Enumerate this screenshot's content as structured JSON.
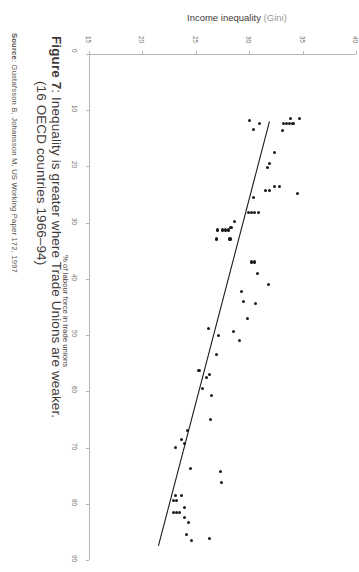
{
  "caption": {
    "figure_label": "Figure 7",
    "line1": ": Inequality is greater where Trade Unions are weaker.",
    "line2": "(16 OECD countries 1966–94)",
    "full_line1": "Figure 7: Inequality is greater where Trade Unions are weaker.",
    "full_line2": "(16 OECD countries 1966–94)"
  },
  "source": {
    "label": "Source",
    "text": ": Gustafsson B, Johansson M, US Working Paper 172, 1997"
  },
  "chart_data": {
    "type": "scatter",
    "title": "Figure 7: Inequality is greater where Trade Unions are weaker. (16 OECD countries 1966–94)",
    "xlabel": "Income inequality (Gini)",
    "xlabel_main": "Income inequality",
    "xlabel_paren": "(Gini)",
    "ylabel": "% of labour force in trade unions",
    "xlim": [
      15,
      40
    ],
    "ylim": [
      0,
      90
    ],
    "xticks": [
      15,
      20,
      25,
      30,
      35,
      40
    ],
    "yticks": [
      0,
      10,
      20,
      30,
      40,
      50,
      60,
      70,
      80,
      90
    ],
    "grid": false,
    "legend": "none",
    "axis_orientation": "x-axis on top, y-axis inverted (0 at top, 90 at bottom); whole figure rotated 90 degrees",
    "marker_color": "#1b1b1b",
    "axis_color": "#b9b7b5",
    "trendline": {
      "present": true,
      "color": "#1b1b1b",
      "description": "negative slope: higher union density associates with lower Gini",
      "x_start": 31.9,
      "y_start": 12.0,
      "x_end": 21.5,
      "y_end": 87.5
    },
    "points": [
      {
        "x": 33.9,
        "y": 11.5
      },
      {
        "x": 34.7,
        "y": 11.5
      },
      {
        "x": 30.0,
        "y": 11.8
      },
      {
        "x": 33.2,
        "y": 12.3
      },
      {
        "x": 33.5,
        "y": 12.3
      },
      {
        "x": 33.8,
        "y": 12.3
      },
      {
        "x": 34.1,
        "y": 12.3
      },
      {
        "x": 31.0,
        "y": 12.4
      },
      {
        "x": 30.4,
        "y": 13.4
      },
      {
        "x": 33.1,
        "y": 13.6
      },
      {
        "x": 32.4,
        "y": 17.5
      },
      {
        "x": 31.9,
        "y": 19.5
      },
      {
        "x": 31.7,
        "y": 20.2
      },
      {
        "x": 32.4,
        "y": 23.6
      },
      {
        "x": 32.8,
        "y": 23.6
      },
      {
        "x": 31.5,
        "y": 24.3
      },
      {
        "x": 31.9,
        "y": 24.2
      },
      {
        "x": 34.5,
        "y": 24.8
      },
      {
        "x": 30.4,
        "y": 25.5
      },
      {
        "x": 29.9,
        "y": 28.2
      },
      {
        "x": 30.2,
        "y": 28.2
      },
      {
        "x": 30.5,
        "y": 28.2
      },
      {
        "x": 30.9,
        "y": 28.2
      },
      {
        "x": 28.6,
        "y": 29.8
      },
      {
        "x": 27.0,
        "y": 31.3
      },
      {
        "x": 27.5,
        "y": 31.3
      },
      {
        "x": 27.8,
        "y": 31.3
      },
      {
        "x": 28.1,
        "y": 31.3
      },
      {
        "x": 28.3,
        "y": 30.9
      },
      {
        "x": 26.9,
        "y": 32.9
      },
      {
        "x": 28.2,
        "y": 32.9
      },
      {
        "x": 30.2,
        "y": 37.0
      },
      {
        "x": 30.5,
        "y": 37.0
      },
      {
        "x": 30.8,
        "y": 39.1
      },
      {
        "x": 31.8,
        "y": 41.0
      },
      {
        "x": 29.3,
        "y": 42.2
      },
      {
        "x": 29.5,
        "y": 44.0
      },
      {
        "x": 30.6,
        "y": 44.4
      },
      {
        "x": 29.8,
        "y": 47.1
      },
      {
        "x": 26.2,
        "y": 48.9
      },
      {
        "x": 28.5,
        "y": 49.4
      },
      {
        "x": 27.1,
        "y": 50.0
      },
      {
        "x": 29.1,
        "y": 51.0
      },
      {
        "x": 26.9,
        "y": 53.5
      },
      {
        "x": 25.3,
        "y": 56.3
      },
      {
        "x": 26.3,
        "y": 57.0
      },
      {
        "x": 26.0,
        "y": 57.6
      },
      {
        "x": 25.6,
        "y": 59.5
      },
      {
        "x": 26.5,
        "y": 60.8
      },
      {
        "x": 26.4,
        "y": 65.0
      },
      {
        "x": 24.2,
        "y": 67.0
      },
      {
        "x": 23.7,
        "y": 68.5
      },
      {
        "x": 23.9,
        "y": 69.2
      },
      {
        "x": 23.1,
        "y": 70.0
      },
      {
        "x": 24.5,
        "y": 73.7
      },
      {
        "x": 27.3,
        "y": 74.2
      },
      {
        "x": 27.4,
        "y": 76.2
      },
      {
        "x": 23.1,
        "y": 78.6
      },
      {
        "x": 23.7,
        "y": 78.6
      },
      {
        "x": 22.9,
        "y": 79.4
      },
      {
        "x": 23.2,
        "y": 79.4
      },
      {
        "x": 23.9,
        "y": 80.6
      },
      {
        "x": 22.9,
        "y": 81.6
      },
      {
        "x": 23.2,
        "y": 81.6
      },
      {
        "x": 23.5,
        "y": 81.6
      },
      {
        "x": 23.9,
        "y": 82.5
      },
      {
        "x": 24.3,
        "y": 83.4
      },
      {
        "x": 24.1,
        "y": 85.5
      },
      {
        "x": 24.6,
        "y": 86.5
      },
      {
        "x": 26.3,
        "y": 86.2
      }
    ]
  }
}
